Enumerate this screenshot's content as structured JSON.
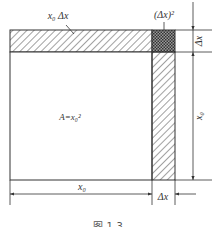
{
  "figure": {
    "caption": "图 1-3",
    "labels": {
      "top_strip": "x₀ Δx",
      "corner_square": "(Δx)²",
      "main_area": "A=x₀²",
      "right_dim_small": "Δx",
      "right_dim_large": "x₀",
      "bottom_dim_large": "x₀",
      "bottom_dim_small": "Δx"
    },
    "colors": {
      "stroke": "#333333",
      "hatch": "#444444",
      "crosshatch": "#555555",
      "background": "#ffffff"
    }
  }
}
